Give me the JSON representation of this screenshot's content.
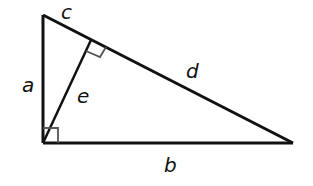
{
  "diagram": {
    "type": "right-triangle-with-altitude",
    "stroke_color": "#111111",
    "marker_color": "#555555",
    "background": "#ffffff",
    "vertices": {
      "top": [
        43,
        15
      ],
      "right_angle": [
        43,
        143
      ],
      "right": [
        293,
        143
      ],
      "altitude_foot": [
        91,
        41
      ]
    },
    "labels": {
      "a": "a",
      "b": "b",
      "c": "c",
      "d": "d",
      "e": "e"
    },
    "right_angle_markers": [
      {
        "location": "bottom-left vertex"
      },
      {
        "location": "altitude foot on hypotenuse"
      }
    ]
  }
}
